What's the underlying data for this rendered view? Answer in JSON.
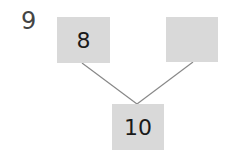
{
  "question": {
    "number": "9"
  },
  "number_bond": {
    "parts": [
      {
        "id": "left",
        "value": "8"
      },
      {
        "id": "right",
        "value": ""
      }
    ],
    "whole": {
      "value": "10"
    }
  },
  "colors": {
    "box_fill": "#d9d9d9",
    "line": "#888888",
    "text": "#1a1a1a",
    "question_number": "#444444"
  }
}
